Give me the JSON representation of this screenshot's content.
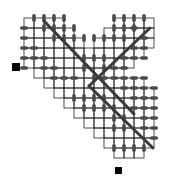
{
  "diagram": {
    "width": 184,
    "height": 183,
    "background": "#ffffff",
    "cell": 10,
    "origin": [
      24,
      18
    ],
    "colors": {
      "grid": "#222222",
      "bar": "#4a4a4a",
      "diagonal": "#3a3a3a",
      "marker": "#000000",
      "faint": "#bbbbbb"
    },
    "cells": [
      [
        0,
        0
      ],
      [
        1,
        0
      ],
      [
        2,
        0
      ],
      [
        3,
        0
      ],
      [
        9,
        0
      ],
      [
        10,
        0
      ],
      [
        11,
        0
      ],
      [
        12,
        0
      ],
      [
        0,
        1
      ],
      [
        1,
        1
      ],
      [
        2,
        1
      ],
      [
        3,
        1
      ],
      [
        4,
        1
      ],
      [
        8,
        1
      ],
      [
        9,
        1
      ],
      [
        10,
        1
      ],
      [
        11,
        1
      ],
      [
        12,
        1
      ],
      [
        0,
        2
      ],
      [
        1,
        2
      ],
      [
        2,
        2
      ],
      [
        3,
        2
      ],
      [
        4,
        2
      ],
      [
        5,
        2
      ],
      [
        7,
        2
      ],
      [
        8,
        2
      ],
      [
        9,
        2
      ],
      [
        10,
        2
      ],
      [
        11,
        2
      ],
      [
        12,
        2
      ],
      [
        0,
        3
      ],
      [
        1,
        3
      ],
      [
        2,
        3
      ],
      [
        3,
        3
      ],
      [
        4,
        3
      ],
      [
        5,
        3
      ],
      [
        6,
        3
      ],
      [
        7,
        3
      ],
      [
        8,
        3
      ],
      [
        9,
        3
      ],
      [
        10,
        3
      ],
      [
        11,
        3
      ],
      [
        0,
        4
      ],
      [
        1,
        4
      ],
      [
        2,
        4
      ],
      [
        3,
        4
      ],
      [
        4,
        4
      ],
      [
        5,
        4
      ],
      [
        6,
        4
      ],
      [
        7,
        4
      ],
      [
        8,
        4
      ],
      [
        9,
        4
      ],
      [
        10,
        4
      ],
      [
        1,
        5
      ],
      [
        2,
        5
      ],
      [
        3,
        5
      ],
      [
        4,
        5
      ],
      [
        5,
        5
      ],
      [
        6,
        5
      ],
      [
        7,
        5
      ],
      [
        8,
        5
      ],
      [
        9,
        5
      ],
      [
        2,
        6
      ],
      [
        3,
        6
      ],
      [
        4,
        6
      ],
      [
        5,
        6
      ],
      [
        6,
        6
      ],
      [
        7,
        6
      ],
      [
        8,
        6
      ],
      [
        9,
        6
      ],
      [
        10,
        6
      ],
      [
        11,
        6
      ],
      [
        3,
        7
      ],
      [
        4,
        7
      ],
      [
        5,
        7
      ],
      [
        6,
        7
      ],
      [
        7,
        7
      ],
      [
        8,
        7
      ],
      [
        9,
        7
      ],
      [
        10,
        7
      ],
      [
        11,
        7
      ],
      [
        12,
        7
      ],
      [
        4,
        8
      ],
      [
        5,
        8
      ],
      [
        6,
        8
      ],
      [
        7,
        8
      ],
      [
        8,
        8
      ],
      [
        9,
        8
      ],
      [
        10,
        8
      ],
      [
        11,
        8
      ],
      [
        12,
        8
      ],
      [
        5,
        9
      ],
      [
        6,
        9
      ],
      [
        7,
        9
      ],
      [
        8,
        9
      ],
      [
        9,
        9
      ],
      [
        10,
        9
      ],
      [
        11,
        9
      ],
      [
        12,
        9
      ],
      [
        6,
        10
      ],
      [
        7,
        10
      ],
      [
        8,
        10
      ],
      [
        9,
        10
      ],
      [
        10,
        10
      ],
      [
        11,
        10
      ],
      [
        12,
        10
      ],
      [
        7,
        11
      ],
      [
        8,
        11
      ],
      [
        9,
        11
      ],
      [
        10,
        11
      ],
      [
        11,
        11
      ],
      [
        12,
        11
      ],
      [
        8,
        12
      ],
      [
        9,
        12
      ],
      [
        10,
        12
      ],
      [
        11,
        12
      ],
      [
        12,
        12
      ],
      [
        9,
        13
      ],
      [
        10,
        13
      ],
      [
        11,
        13
      ]
    ],
    "vbars": [
      [
        1,
        0
      ],
      [
        2,
        0
      ],
      [
        3,
        0
      ],
      [
        4,
        0
      ],
      [
        9,
        0
      ],
      [
        10,
        0
      ],
      [
        11,
        0
      ],
      [
        12,
        0
      ],
      [
        2,
        1
      ],
      [
        3,
        1
      ],
      [
        4,
        1
      ],
      [
        5,
        1
      ],
      [
        9,
        1
      ],
      [
        10,
        1
      ],
      [
        11,
        1
      ],
      [
        3,
        2
      ],
      [
        4,
        2
      ],
      [
        5,
        2
      ],
      [
        6,
        2
      ],
      [
        7,
        2
      ],
      [
        8,
        2
      ],
      [
        9,
        2
      ],
      [
        10,
        2
      ],
      [
        6,
        4
      ],
      [
        7,
        4
      ],
      [
        8,
        4
      ],
      [
        6,
        5
      ],
      [
        8,
        5
      ],
      [
        7,
        6
      ],
      [
        5,
        8
      ],
      [
        6,
        8
      ],
      [
        7,
        8
      ],
      [
        8,
        8
      ],
      [
        6,
        9
      ],
      [
        7,
        9
      ],
      [
        8,
        9
      ],
      [
        9,
        9
      ],
      [
        9,
        10
      ],
      [
        10,
        10
      ],
      [
        9,
        11
      ],
      [
        10,
        11
      ],
      [
        9,
        13
      ],
      [
        10,
        13
      ],
      [
        11,
        13
      ],
      [
        12,
        13
      ]
    ],
    "hbars": [
      [
        0,
        1
      ],
      [
        0,
        2
      ],
      [
        0,
        3
      ],
      [
        0,
        4
      ],
      [
        0,
        5
      ],
      [
        1,
        3
      ],
      [
        1,
        4
      ],
      [
        2,
        4
      ],
      [
        2,
        5
      ],
      [
        3,
        5
      ],
      [
        3,
        6
      ],
      [
        4,
        6
      ],
      [
        5,
        6
      ],
      [
        11,
        1
      ],
      [
        12,
        2
      ],
      [
        11,
        3
      ],
      [
        12,
        3
      ],
      [
        10,
        4
      ],
      [
        11,
        4
      ],
      [
        12,
        4
      ],
      [
        9,
        5
      ],
      [
        10,
        5
      ],
      [
        8,
        6
      ],
      [
        9,
        6
      ],
      [
        10,
        6
      ],
      [
        11,
        6
      ],
      [
        12,
        6
      ],
      [
        10,
        7
      ],
      [
        11,
        7
      ],
      [
        12,
        7
      ],
      [
        13,
        7
      ],
      [
        11,
        8
      ],
      [
        12,
        8
      ],
      [
        13,
        8
      ],
      [
        11,
        9
      ],
      [
        12,
        9
      ],
      [
        13,
        9
      ],
      [
        12,
        10
      ],
      [
        13,
        10
      ],
      [
        12,
        11
      ],
      [
        13,
        11
      ],
      [
        13,
        12
      ]
    ],
    "diagonals": [
      {
        "from": [
          2,
          0.3
        ],
        "to": [
          11,
          9.6
        ]
      },
      {
        "from": [
          12.6,
          1.0
        ],
        "to": [
          6.5,
          6.8
        ]
      },
      {
        "from": [
          6.5,
          6.8
        ],
        "to": [
          12.9,
          13.0
        ]
      }
    ],
    "markers": [
      {
        "name": "start-marker",
        "x": 12,
        "y": 63,
        "size": 8
      },
      {
        "name": "end-marker",
        "x": 115,
        "y": 167,
        "size": 7
      }
    ]
  }
}
